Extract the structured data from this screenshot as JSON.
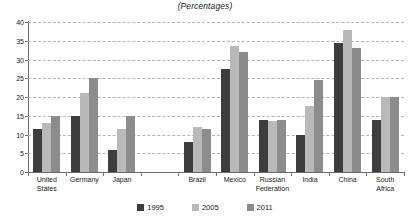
{
  "chart_data": {
    "type": "bar",
    "title": "(Percentages)",
    "xlabel": "",
    "ylabel": "",
    "ylim": [
      0,
      40
    ],
    "yticks": [
      0,
      5,
      10,
      15,
      20,
      25,
      30,
      35,
      40
    ],
    "grid": true,
    "legend_position": "bottom",
    "categories": [
      "United States",
      "Germany",
      "Japan",
      "",
      "Brazil",
      "Mexico",
      "Russian Federation",
      "India",
      "China",
      "South Africa"
    ],
    "series": [
      {
        "name": "1995",
        "color": "#3d3d3d",
        "values": [
          11.5,
          15.0,
          6.0,
          null,
          8.0,
          27.5,
          14.0,
          10.0,
          34.5,
          14.0
        ]
      },
      {
        "name": "2005",
        "color": "#b9b9b9",
        "values": [
          13.0,
          21.0,
          11.5,
          null,
          12.0,
          33.5,
          13.5,
          17.5,
          38.0,
          20.0
        ]
      },
      {
        "name": "2011",
        "color": "#8c8c8c",
        "values": [
          15.0,
          25.0,
          15.0,
          null,
          11.5,
          32.0,
          14.0,
          24.5,
          33.0,
          20.0
        ]
      }
    ]
  },
  "axis": {
    "tick_labels": [
      "0",
      "5",
      "10",
      "15",
      "20",
      "25",
      "30",
      "35",
      "40"
    ]
  },
  "category_labels": [
    {
      "line1": "United",
      "line2": "States"
    },
    {
      "line1": "Germany",
      "line2": ""
    },
    {
      "line1": "Japan",
      "line2": ""
    },
    {
      "line1": "",
      "line2": ""
    },
    {
      "line1": "Brazil",
      "line2": ""
    },
    {
      "line1": "Mexico",
      "line2": ""
    },
    {
      "line1": "Russian",
      "line2": "Federation"
    },
    {
      "line1": "India",
      "line2": ""
    },
    {
      "line1": "China",
      "line2": ""
    },
    {
      "line1": "South",
      "line2": "Africa"
    }
  ],
  "legend": [
    {
      "label": "1995",
      "color": "#3d3d3d"
    },
    {
      "label": "2005",
      "color": "#b9b9b9"
    },
    {
      "label": "2011",
      "color": "#8c8c8c"
    }
  ],
  "colors": {
    "axis": "#6e6e6e",
    "grid": "#b5b5b5",
    "text": "#1a1a1a",
    "background": "#ffffff"
  }
}
